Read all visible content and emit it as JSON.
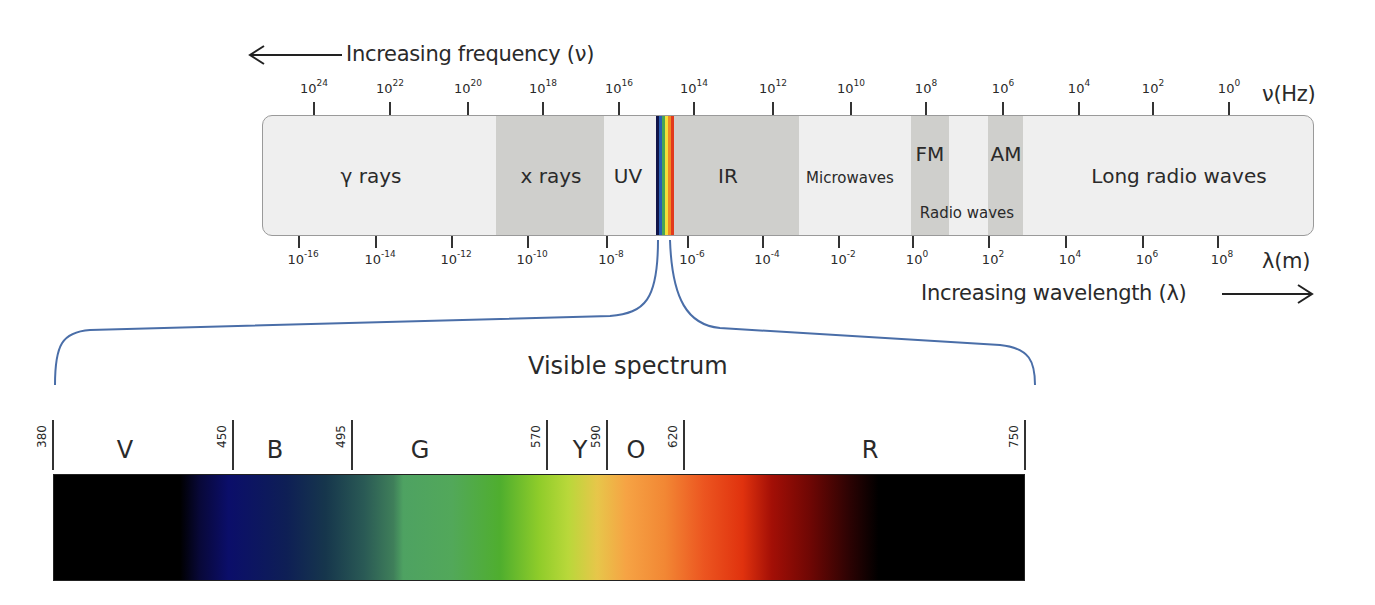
{
  "frequency_axis": {
    "title": "Increasing frequency (ν)",
    "unit_label": "ν(Hz)",
    "ticks": [
      {
        "base": "10",
        "exp": "24",
        "x": 314
      },
      {
        "base": "10",
        "exp": "22",
        "x": 390
      },
      {
        "base": "10",
        "exp": "20",
        "x": 468
      },
      {
        "base": "10",
        "exp": "18",
        "x": 543
      },
      {
        "base": "10",
        "exp": "16",
        "x": 619
      },
      {
        "base": "10",
        "exp": "14",
        "x": 694
      },
      {
        "base": "10",
        "exp": "12",
        "x": 773
      },
      {
        "base": "10",
        "exp": "10",
        "x": 851
      },
      {
        "base": "10",
        "exp": "8",
        "x": 926
      },
      {
        "base": "10",
        "exp": "6",
        "x": 1003
      },
      {
        "base": "10",
        "exp": "4",
        "x": 1079
      },
      {
        "base": "10",
        "exp": "2",
        "x": 1153
      },
      {
        "base": "10",
        "exp": "0",
        "x": 1229
      }
    ]
  },
  "wavelength_axis": {
    "title": "Increasing wavelength (λ)",
    "unit_label": "λ(m)",
    "ticks": [
      {
        "base": "10",
        "exp": "-16",
        "x": 299
      },
      {
        "base": "10",
        "exp": "-14",
        "x": 376
      },
      {
        "base": "10",
        "exp": "-12",
        "x": 452
      },
      {
        "base": "10",
        "exp": "-10",
        "x": 528
      },
      {
        "base": "10",
        "exp": "-8",
        "x": 607
      },
      {
        "base": "10",
        "exp": "-6",
        "x": 688
      },
      {
        "base": "10",
        "exp": "-4",
        "x": 763
      },
      {
        "base": "10",
        "exp": "-2",
        "x": 839
      },
      {
        "base": "10",
        "exp": "0",
        "x": 913
      },
      {
        "base": "10",
        "exp": "2",
        "x": 989
      },
      {
        "base": "10",
        "exp": "4",
        "x": 1066
      },
      {
        "base": "10",
        "exp": "6",
        "x": 1143
      },
      {
        "base": "10",
        "exp": "8",
        "x": 1218
      }
    ]
  },
  "regions": [
    {
      "label": "γ rays",
      "x": 370,
      "y": 60,
      "shaded": false
    },
    {
      "label": "x rays",
      "x": 550,
      "y": 60,
      "shaded": true,
      "left": 233,
      "width": 108
    },
    {
      "label": "UV",
      "x": 627,
      "y": 60,
      "shaded": false
    },
    {
      "label": "IR",
      "x": 727,
      "y": 60,
      "shaded": true,
      "left": 411,
      "width": 125
    },
    {
      "label": "Microwaves",
      "x": 849,
      "y": 62,
      "shaded": false,
      "small": true
    },
    {
      "label": "FM",
      "x": 929,
      "y": 38,
      "shaded": true,
      "left": 648,
      "width": 38
    },
    {
      "label": "AM",
      "x": 1005,
      "y": 38,
      "shaded": true,
      "left": 725,
      "width": 35
    },
    {
      "label": "Radio waves",
      "x": 966,
      "y": 97,
      "shaded": false,
      "small": true
    },
    {
      "label": "Long radio waves",
      "x": 1178,
      "y": 60,
      "shaded": false
    }
  ],
  "rainbow_strip": {
    "colors": [
      "#10144a",
      "#2b5fb3",
      "#4aa655",
      "#f2e03a",
      "#f08a24",
      "#e23a1c"
    ]
  },
  "visible_spectrum": {
    "title": "Visible spectrum",
    "boundaries": [
      {
        "nm": "380",
        "x": 53
      },
      {
        "nm": "450",
        "x": 233
      },
      {
        "nm": "495",
        "x": 352
      },
      {
        "nm": "570",
        "x": 547
      },
      {
        "nm": "590",
        "x": 607
      },
      {
        "nm": "620",
        "x": 684
      },
      {
        "nm": "750",
        "x": 1025
      }
    ],
    "bands": [
      {
        "letter": "V",
        "name": "Violet",
        "x": 125
      },
      {
        "letter": "B",
        "name": "Blue",
        "x": 275
      },
      {
        "letter": "G",
        "name": "Green",
        "x": 420
      },
      {
        "letter": "Y",
        "name": "Yellow",
        "x": 580
      },
      {
        "letter": "O",
        "name": "Orange",
        "x": 636
      },
      {
        "letter": "R",
        "name": "Red",
        "x": 870
      }
    ],
    "gradient_stops": [
      {
        "pct": 0,
        "color": "#000000"
      },
      {
        "pct": 13,
        "color": "#000000"
      },
      {
        "pct": 15,
        "color": "#080838"
      },
      {
        "pct": 18,
        "color": "#0b0e6a"
      },
      {
        "pct": 24,
        "color": "#0e1f55"
      },
      {
        "pct": 28,
        "color": "#16364c"
      },
      {
        "pct": 32,
        "color": "#2a5a55"
      },
      {
        "pct": 35,
        "color": "#3f7f5a"
      },
      {
        "pct": 36,
        "color": "#4ea262"
      },
      {
        "pct": 41,
        "color": "#52a85a"
      },
      {
        "pct": 46,
        "color": "#4fae2e"
      },
      {
        "pct": 50,
        "color": "#8fcc2a"
      },
      {
        "pct": 53,
        "color": "#b9d83a"
      },
      {
        "pct": 56,
        "color": "#e7c64a"
      },
      {
        "pct": 59,
        "color": "#f6a344"
      },
      {
        "pct": 63,
        "color": "#f28734"
      },
      {
        "pct": 67,
        "color": "#ec5520"
      },
      {
        "pct": 71,
        "color": "#e0320e"
      },
      {
        "pct": 74,
        "color": "#a30f06"
      },
      {
        "pct": 78,
        "color": "#6e0704"
      },
      {
        "pct": 82,
        "color": "#2c0303"
      },
      {
        "pct": 85,
        "color": "#000000"
      },
      {
        "pct": 100,
        "color": "#000000"
      }
    ]
  },
  "colors": {
    "bar_fill": "#efefef",
    "band_fill": "#cfcfcc",
    "brace": "#4a6ea8",
    "ink": "#2a2a2a"
  }
}
